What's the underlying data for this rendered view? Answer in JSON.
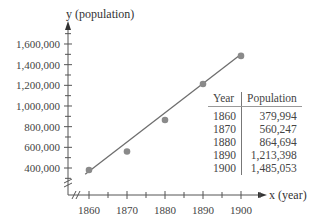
{
  "chart_data": {
    "type": "scatter",
    "title": "",
    "xlabel": "x (year)",
    "ylabel": "y (population)",
    "x_ticks": [
      1860,
      1870,
      1880,
      1890,
      1900
    ],
    "x_tick_labels": [
      "1860",
      "1870",
      "1880",
      "1890",
      "1900"
    ],
    "y_ticks": [
      400000,
      600000,
      800000,
      1000000,
      1200000,
      1400000,
      1600000
    ],
    "y_tick_labels": [
      "400,000",
      "600,000",
      "800,000",
      "1,000,000",
      "1,200,000",
      "1,400,000",
      "1,600,000"
    ],
    "xlim": [
      1855,
      1910
    ],
    "ylim": [
      200000,
      1750000
    ],
    "axis_breaks": true,
    "grid": false,
    "series": [
      {
        "name": "Population",
        "kind": "scatter",
        "x": [
          1860,
          1870,
          1880,
          1890,
          1900
        ],
        "y": [
          379994,
          560247,
          864694,
          1213398,
          1485053
        ]
      },
      {
        "name": "Linear fit",
        "kind": "line",
        "x": [
          1859,
          1900
        ],
        "y": [
          340000,
          1500000
        ]
      }
    ],
    "marker_color": "#8a8a8a",
    "line_color": "#6e6e6e",
    "inset_table": {
      "headers": [
        "Year",
        "Population"
      ],
      "rows": [
        [
          "1860",
          "379,994"
        ],
        [
          "1870",
          "560,247"
        ],
        [
          "1880",
          "864,694"
        ],
        [
          "1890",
          "1,213,398"
        ],
        [
          "1900",
          "1,485,053"
        ]
      ]
    }
  }
}
